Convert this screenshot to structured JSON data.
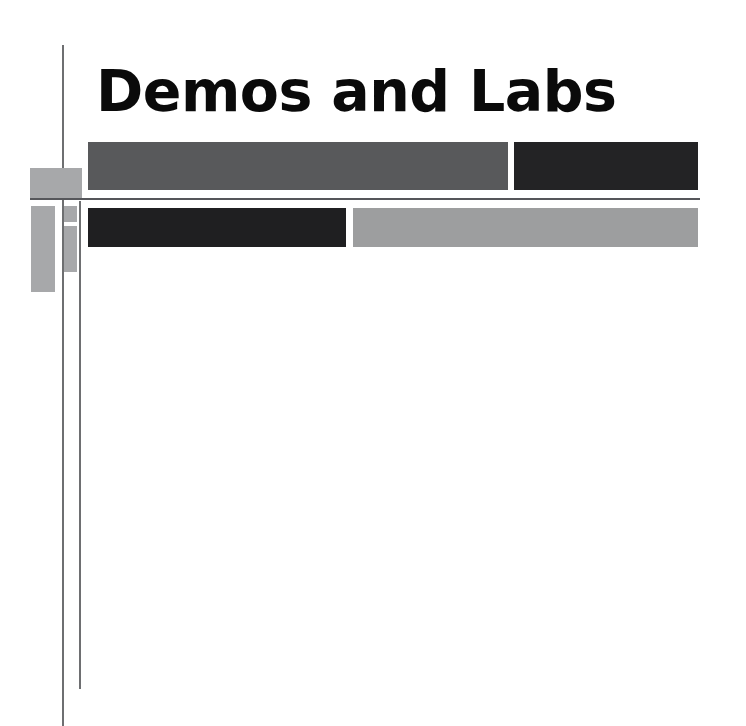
{
  "slide": {
    "title": "Demos and Labs",
    "canvas": {
      "width": 746,
      "height": 726
    },
    "background_color": "#ffffff"
  },
  "theme": {
    "title_color": "#0a0a0a",
    "rule_color": "#6e6f71",
    "divider_color": "#55565a",
    "accent_color": "#a7a8aa",
    "medium_gray": "#58595b",
    "light_gray": "#9d9e9f",
    "dark": "#232325",
    "darkest": "#1f1f21"
  },
  "content_blocks": [
    {
      "name": "row1-left",
      "color": "#58595b",
      "width": 420,
      "height": 48
    },
    {
      "name": "row1-right",
      "color": "#232325",
      "width": 184,
      "height": 48
    },
    {
      "name": "row2-left",
      "color": "#1f1f21",
      "width": 258,
      "height": 39
    },
    {
      "name": "row2-right",
      "color": "#9d9e9f",
      "width": 345,
      "height": 39
    }
  ],
  "accents": [
    {
      "name": "top-wide",
      "color": "#a7a8aa",
      "width": 52,
      "height": 30
    },
    {
      "name": "left-tall",
      "color": "#a7a8aa",
      "width": 24,
      "height": 86
    },
    {
      "name": "small-sq",
      "color": "#a7a8aa",
      "width": 13,
      "height": 16
    },
    {
      "name": "small-tall",
      "color": "#a7a8aa",
      "width": 13,
      "height": 46
    }
  ]
}
